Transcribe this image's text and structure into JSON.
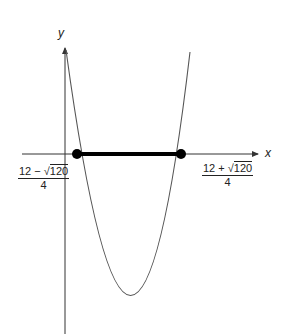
{
  "diagram": {
    "type": "parabola-interval",
    "axes": {
      "x_label": "x",
      "y_label": "y"
    },
    "left_root": {
      "num_prefix": "12 − √",
      "radicand": "120",
      "den": "4"
    },
    "right_root": {
      "num_prefix": "12 + √",
      "radicand": "120",
      "den": "4"
    },
    "highlighted_segment": "between roots on x-axis",
    "colors": {
      "curve": "#555555",
      "segment": "#000000",
      "axis": "#333333"
    }
  }
}
